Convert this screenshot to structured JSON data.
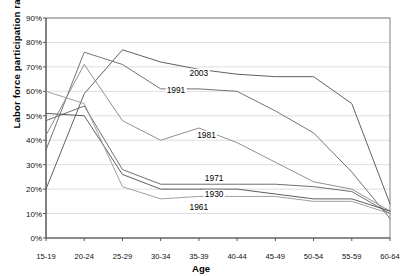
{
  "chart_data": {
    "type": "line",
    "title": "",
    "xlabel": "Age",
    "ylabel": "Labor force participation rate",
    "categories": [
      "15-19",
      "20-24",
      "25-29",
      "30-34",
      "35-39",
      "40-44",
      "45-49",
      "50-54",
      "55-59",
      "60-64"
    ],
    "ylim": [
      0,
      90
    ],
    "ytick_labels": [
      "0%",
      "10%",
      "20%",
      "30%",
      "40%",
      "50%",
      "60%",
      "70%",
      "80%",
      "90%"
    ],
    "ytick_values": [
      0,
      10,
      20,
      30,
      40,
      50,
      60,
      70,
      80,
      90
    ],
    "grid": true,
    "legend_position": "inline-annotations",
    "series": [
      {
        "name": "2003",
        "values": [
          20,
          59,
          77,
          72,
          69,
          67,
          66,
          66,
          55,
          14
        ],
        "label_x": "35-39",
        "label_y": 67.5,
        "color": "#595959"
      },
      {
        "name": "1991",
        "values": [
          36,
          76,
          71,
          61,
          61,
          60,
          52,
          43,
          27,
          8
        ],
        "label_x": "32-37",
        "label_y": 60.5,
        "color": "#6b6b6b"
      },
      {
        "name": "1981",
        "values": [
          42,
          71,
          48,
          40,
          45,
          39,
          31,
          23,
          20,
          11
        ],
        "label_x": "36-41",
        "label_y": 42.0,
        "color": "#8a8a8a"
      },
      {
        "name": "1971",
        "values": [
          48,
          54,
          28,
          22,
          22,
          22,
          22,
          21,
          19,
          10
        ],
        "label_x": "37-42",
        "label_y": 24.5,
        "color": "#666666"
      },
      {
        "name": "1930",
        "values": [
          51,
          50,
          26,
          20,
          20,
          20,
          18,
          16,
          16,
          11
        ],
        "label_x": "37-42",
        "label_y": 18.0,
        "color": "#555555"
      },
      {
        "name": "1961",
        "values": [
          60,
          55,
          21,
          16,
          17,
          17,
          17,
          15,
          15,
          10
        ],
        "label_x": "35-40",
        "label_y": 12.5,
        "color": "#9a9a9a"
      }
    ]
  },
  "axis": {
    "x_title": "Age",
    "y_title": "Labor force participation rate"
  }
}
